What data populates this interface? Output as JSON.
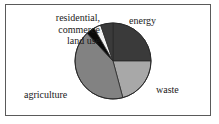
{
  "figure": {
    "background_color": "#ffffff",
    "border_color": "#5a5a5a"
  },
  "labels": {
    "residential_line1": "residential,",
    "residential_line2": "commerce",
    "residential_line3": "land use",
    "energy": "energy",
    "waste": "waste",
    "agriculture": "agriculture"
  },
  "chart_data": {
    "type": "pie",
    "title": "",
    "xlabel": "",
    "ylabel": "",
    "legend_position": "none",
    "grid": false,
    "start_angle_deg": 0,
    "direction": "clockwise",
    "center": [
      113,
      61
    ],
    "radius": 38,
    "categories": [
      "energy",
      "waste",
      "agriculture",
      "land use",
      "commerce",
      "residential"
    ],
    "values": [
      25,
      21,
      42,
      3.5,
      3,
      5.5
    ],
    "slices": [
      {
        "label": "energy",
        "value": 25,
        "angle_deg": 90,
        "color": "#3a3a3a"
      },
      {
        "label": "waste",
        "value": 21,
        "angle_deg": 75,
        "color": "#a8a8a8"
      },
      {
        "label": "agriculture",
        "value": 42,
        "angle_deg": 152,
        "color": "#828282"
      },
      {
        "label": "land use",
        "value": 3.5,
        "angle_deg": 13,
        "color": "#0a0a0a"
      },
      {
        "label": "commerce",
        "value": 3,
        "angle_deg": 11,
        "color": "#f2f2f2"
      },
      {
        "label": "residential",
        "value": 5.5,
        "angle_deg": 19,
        "color": "#3a3a3a"
      }
    ],
    "outline_color": "#2a2a2a"
  }
}
